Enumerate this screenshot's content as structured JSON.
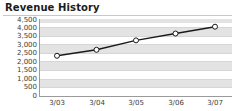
{
  "widget": {
    "title": "Revenue History"
  },
  "chart_data": {
    "type": "line",
    "title": "Revenue History",
    "xlabel": "",
    "ylabel": "",
    "categories": [
      "3/03",
      "3/04",
      "3/05",
      "3/06",
      "3/07"
    ],
    "values": [
      2350,
      2700,
      3250,
      3650,
      4050
    ],
    "series": [
      {
        "name": "Revenue",
        "values": [
          2350,
          2700,
          3250,
          3650,
          4050
        ]
      }
    ],
    "ylim": [
      0,
      4500
    ],
    "ytick_values": [
      4500,
      4000,
      3500,
      3000,
      2500,
      2000,
      1500,
      1000,
      500,
      0
    ],
    "ytick_labels": [
      "4,500",
      "4,000",
      "3,500",
      "3,000",
      "2,500",
      "2,000",
      "1,500",
      "1,000",
      "500",
      "0"
    ],
    "xtick_labels": [
      "3/03",
      "3/04",
      "3/05",
      "3/06",
      "3/07"
    ],
    "grid": true,
    "grid_style": "alternating-horizontal-bands",
    "legend": "none",
    "marker": "open-circle",
    "line_color": "#1a1a1a",
    "marker_fill": "#ffffff",
    "marker_stroke": "#1a1a1a",
    "band_color": "#e3e3e3",
    "plot_background": "#ffffff",
    "axis_color": "#9a9a9a",
    "text_color": "#3c3c3c"
  }
}
